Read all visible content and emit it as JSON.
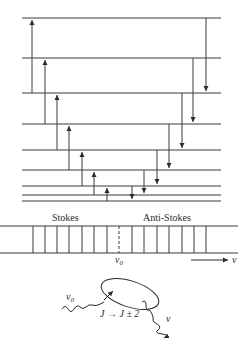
{
  "energy_levels": {
    "count": 9,
    "note": "Rotational energy levels, spacing decreasing toward the bottom (lowest J)"
  },
  "transitions": {
    "stokes": [
      {
        "from_level": 8,
        "to_level": 6
      },
      {
        "from_level": 7,
        "to_level": 5
      },
      {
        "from_level": 6,
        "to_level": 4
      },
      {
        "from_level": 5,
        "to_level": 3
      },
      {
        "from_level": 4,
        "to_level": 2
      },
      {
        "from_level": 3,
        "to_level": 1
      },
      {
        "from_level": 2,
        "to_level": 0
      }
    ],
    "anti_stokes": [
      {
        "from_level": 0,
        "to_level": 2
      },
      {
        "from_level": 1,
        "to_level": 3
      },
      {
        "from_level": 2,
        "to_level": 4
      },
      {
        "from_level": 3,
        "to_level": 5
      },
      {
        "from_level": 4,
        "to_level": 6
      },
      {
        "from_level": 5,
        "to_level": 7
      },
      {
        "from_level": 6,
        "to_level": 8
      }
    ]
  },
  "spectrum": {
    "stokes_label": "Stokes",
    "anti_stokes_label": "Anti-Stokes",
    "center_label": "ν",
    "center_subscript": "0",
    "axis_label": "ν",
    "stokes_line_count": 7,
    "anti_stokes_line_count": 7
  },
  "scattering": {
    "incident_label": "ν",
    "incident_subscript": "0",
    "scattered_label": "ν",
    "selection_rule": "J → J ± 2"
  }
}
